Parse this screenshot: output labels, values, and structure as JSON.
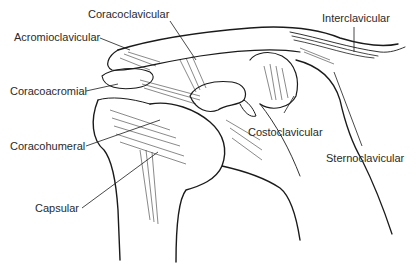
{
  "diagram": {
    "labels": {
      "coracoclavicular": "Coracoclavicular",
      "acromioclavicular": "Acromioclavicular",
      "interclavicular": "Interclavicular",
      "coracoacromial": "Coracoacromial",
      "coracohumeral": "Coracohumeral",
      "costoclavicular": "Costoclavicular",
      "sternoclavicular": "Sternoclavicular",
      "capsular": "Capsular"
    },
    "colors": {
      "ink": "#1a1a1a",
      "text": "#2a2a2a",
      "background": "#ffffff"
    }
  }
}
